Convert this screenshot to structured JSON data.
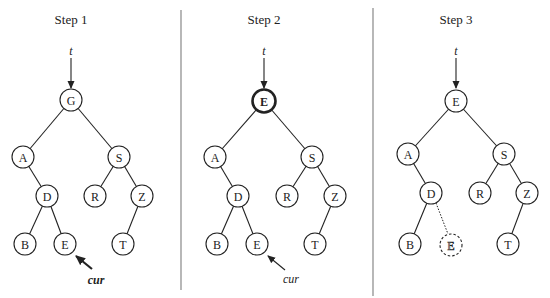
{
  "panels": [
    {
      "title": "Step 1",
      "pointer_label": "t",
      "cursor_label": "cur",
      "nodes": {
        "root": "G",
        "a": "A",
        "s": "S",
        "d": "D",
        "r": "R",
        "z": "Z",
        "b": "B",
        "e": "E",
        "t": "T"
      }
    },
    {
      "title": "Step 2",
      "pointer_label": "t",
      "cursor_label": "cur",
      "nodes": {
        "root": "E",
        "a": "A",
        "s": "S",
        "d": "D",
        "r": "R",
        "z": "Z",
        "b": "B",
        "e": "E",
        "t": "T"
      }
    },
    {
      "title": "Step 3",
      "pointer_label": "t",
      "nodes": {
        "root": "E",
        "a": "A",
        "s": "S",
        "d": "D",
        "r": "R",
        "z": "Z",
        "b": "B",
        "e_removed": "E",
        "t": "T"
      }
    }
  ]
}
